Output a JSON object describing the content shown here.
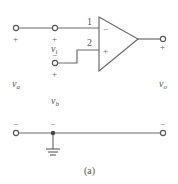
{
  "figure": {
    "caption": "(a)",
    "type": "op-amp circuit",
    "colors": {
      "wire": "#6b6b6b",
      "text": "#555555",
      "background": "#ffffff"
    }
  },
  "opamp": {
    "inverting_pin_label": "1",
    "noninverting_pin_label": "2",
    "inverting_sign": "−",
    "noninverting_sign": "+"
  },
  "terminals": {
    "va_plus": "+",
    "va_minus": "−",
    "vi_plus": "+",
    "vi_minus": "−",
    "vb_plus": "+",
    "vb_minus": "−",
    "vo_plus": "+",
    "vo_minus": "−"
  },
  "labels": {
    "va": "v",
    "va_sub": "a",
    "vi": "v",
    "vi_sub": "i",
    "vb": "v",
    "vb_sub": "b",
    "vo": "v",
    "vo_sub": "o"
  },
  "ground": {
    "symbol": "ground-icon"
  }
}
